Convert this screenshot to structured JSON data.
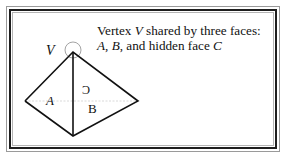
{
  "caption": {
    "line1": {
      "prefix": "Vertex ",
      "var": "V",
      "suffix": " shared by three faces:"
    },
    "line2": {
      "a": "A",
      "sep1": ", ",
      "b": "B",
      "sep2": ", and hidden face ",
      "c": "C"
    }
  },
  "figure": {
    "vertex_label": "V",
    "face_labels": {
      "A": "A",
      "B": "B",
      "C_mirrored": "C"
    },
    "colors": {
      "edge": "#111111",
      "hidden_edge": "#c8c8c8",
      "circle": "#8c8c8c",
      "frame_dark": "#1e1e1e",
      "frame_light": "#9a9a9a"
    }
  }
}
